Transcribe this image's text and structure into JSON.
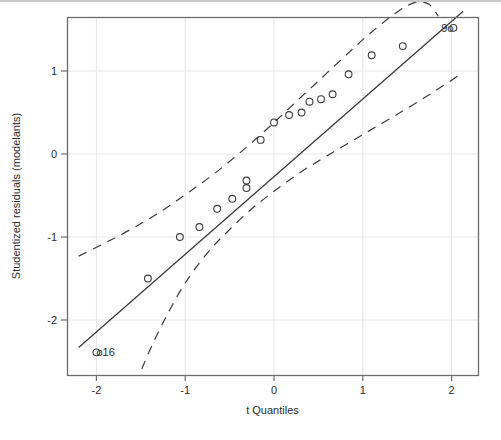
{
  "figure": {
    "kind": "qq-plot",
    "background": "#ffffff",
    "frame_color": "#6b6b6b",
    "grid_color": "#e6e6e6",
    "line_color": "#3a3a3a",
    "point_color": "#3a3a3a"
  },
  "axes": {
    "x_title": "t Quantiles",
    "y_title": "Studentized residuals (modelants)",
    "x_ticks": [
      "-2",
      "-1",
      "0",
      "1",
      "2"
    ],
    "y_ticks": [
      "1",
      "0",
      "-1",
      "-2"
    ],
    "x_tick_values": [
      -2,
      -1,
      0,
      1,
      2
    ],
    "y_tick_values": [
      1,
      0,
      -1,
      -2
    ],
    "xlim": [
      -2.32,
      2.29
    ],
    "ylim": [
      -2.59,
      1.85
    ]
  },
  "annotations": [
    {
      "name": "outlier-label-16",
      "text": "o16",
      "x": -2.0,
      "y": -2.39
    },
    {
      "name": "outlier-label-9",
      "text": "9o",
      "x": 2.02,
      "y": 1.52
    }
  ],
  "chart_data": {
    "type": "scatter",
    "title": "",
    "xlabel": "t Quantiles",
    "ylabel": "Studentized residuals (modelants)",
    "xlim": [
      -2.32,
      2.29
    ],
    "ylim": [
      -2.59,
      1.85
    ],
    "grid": true,
    "legend": "none",
    "series": [
      {
        "name": "Studentized residuals",
        "marker": "open-circle",
        "x": [
          -2.0,
          -1.42,
          -1.06,
          -0.84,
          -0.64,
          -0.47,
          -0.31,
          -0.31,
          -0.15,
          0.0,
          0.17,
          0.31,
          0.4,
          0.53,
          0.66,
          0.84,
          1.1,
          1.45,
          2.02
        ],
        "y": [
          -2.39,
          -1.5,
          -1.0,
          -0.88,
          -0.66,
          -0.54,
          -0.41,
          -0.32,
          0.17,
          0.38,
          0.47,
          0.5,
          0.63,
          0.66,
          0.72,
          0.96,
          1.19,
          1.3,
          1.52
        ]
      }
    ],
    "reference_line": {
      "name": "qq-reference-line",
      "style": "solid",
      "x": [
        -2.2,
        2.13
      ],
      "y": [
        -2.33,
        1.72
      ],
      "slope": 0.935,
      "intercept": -0.275
    },
    "confidence_bands": {
      "style": "dashed",
      "upper": {
        "name": "upper-confidence-band",
        "x": [
          -2.2,
          -1.9,
          -1.6,
          -1.3,
          -1.0,
          -0.7,
          -0.4,
          -0.1,
          0.2,
          0.5,
          0.8,
          1.1,
          1.4,
          1.6,
          1.75,
          1.85
        ],
        "y": [
          -1.23,
          -1.07,
          -0.9,
          -0.71,
          -0.49,
          -0.26,
          0.0,
          0.28,
          0.58,
          0.88,
          1.18,
          1.47,
          1.72,
          1.83,
          1.8,
          1.66
        ]
      },
      "lower": {
        "name": "lower-confidence-band",
        "x": [
          -1.49,
          -1.35,
          -1.2,
          -1.05,
          -0.9,
          -0.7,
          -0.5,
          -0.25,
          0.0,
          0.3,
          0.6,
          0.9,
          1.2,
          1.5,
          1.8,
          2.1
        ],
        "y": [
          -2.59,
          -2.25,
          -1.93,
          -1.64,
          -1.4,
          -1.13,
          -0.91,
          -0.66,
          -0.45,
          -0.22,
          -0.02,
          0.17,
          0.36,
          0.55,
          0.75,
          0.96
        ]
      }
    }
  }
}
